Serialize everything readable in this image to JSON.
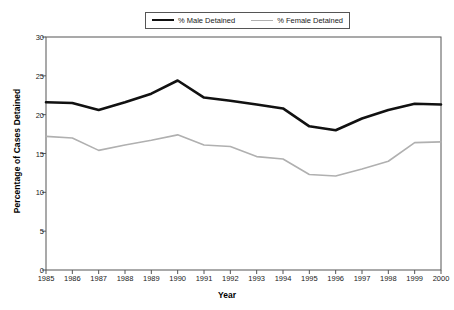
{
  "chart_data": {
    "type": "line",
    "title": "",
    "xlabel": "Year",
    "ylabel": "Percentage of Cases Detained",
    "categories": [
      "1985",
      "1986",
      "1987",
      "1988",
      "1989",
      "1990",
      "1991",
      "1992",
      "1993",
      "1994",
      "1995",
      "1996",
      "1997",
      "1998",
      "1999",
      "2000"
    ],
    "xlim": [
      1985,
      2000
    ],
    "ylim": [
      0,
      30
    ],
    "yticks": [
      0,
      5,
      10,
      15,
      20,
      25,
      30
    ],
    "grid": false,
    "legend_position": "top-center",
    "series": [
      {
        "name": "% Male Detained",
        "color": "#111111",
        "values": [
          21.6,
          21.5,
          20.6,
          21.6,
          22.7,
          24.4,
          22.2,
          21.8,
          21.3,
          20.8,
          18.5,
          18.0,
          19.5,
          20.6,
          21.4,
          21.3
        ]
      },
      {
        "name": "% Female Detained",
        "color": "#b0b0b0",
        "values": [
          17.2,
          17.0,
          15.4,
          16.1,
          16.7,
          17.4,
          16.1,
          15.9,
          14.6,
          14.3,
          12.3,
          12.1,
          13.0,
          14.0,
          16.4,
          16.5
        ]
      }
    ]
  },
  "legend": {
    "entries": [
      {
        "label": "% Male Detained"
      },
      {
        "label": "% Female Detained"
      }
    ]
  },
  "axes": {
    "y_title": "Percentage of Cases Detained",
    "x_title": "Year"
  }
}
